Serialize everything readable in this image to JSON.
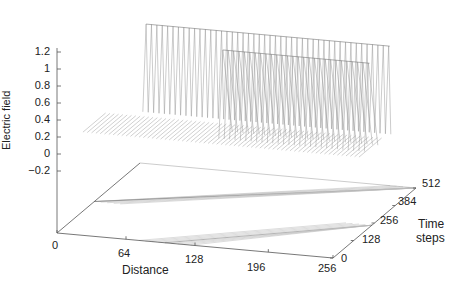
{
  "chart_data": {
    "type": "surface3d",
    "title": "",
    "zlabel": "Electric field",
    "xlabel": "Distance",
    "ylabel": "Time steps",
    "z_ticks": [
      "1.2",
      "1",
      "0.8",
      "0.6",
      "0.4",
      "0.2",
      "0",
      "−0.2"
    ],
    "z_tick_values": [
      1.2,
      1.0,
      0.8,
      0.6,
      0.4,
      0.2,
      0,
      -0.2
    ],
    "x_ticks": [
      "0",
      "64",
      "128",
      "196",
      "256"
    ],
    "x_tick_values": [
      0,
      64,
      128,
      196,
      256
    ],
    "t_ticks": [
      "0",
      "128",
      "256",
      "384",
      "512"
    ],
    "t_tick_values": [
      0,
      128,
      256,
      384,
      512
    ],
    "xlim": [
      0,
      256
    ],
    "tlim": [
      0,
      512
    ],
    "zlim": [
      -0.2,
      1.2
    ],
    "surface": "Triangular pulse of amplitude 1 propagating along distance over time, split into two ridges; flat zero elsewhere",
    "pulses": [
      {
        "name": "back ridge",
        "peak": 1.0,
        "x_at_t0": 0,
        "description": "ridge visible at back, plateau height ~1"
      },
      {
        "name": "front ridge",
        "peak": 1.0,
        "description": "ridge visible in front, peak ~1"
      }
    ],
    "contour_projection": "Contours of the pulses projected onto the floor plane as two diagonal bands",
    "grid": false,
    "legend": null
  },
  "labels": {
    "zlabel": "Electric field",
    "xlabel": "Distance",
    "tlabel_line1": "Time",
    "tlabel_line2": "steps"
  }
}
